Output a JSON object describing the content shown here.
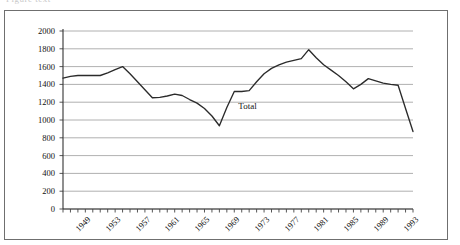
{
  "clipped_caption": "Figure text",
  "chart_data": {
    "type": "line",
    "title": "",
    "xlabel": "",
    "ylabel": "",
    "ylim": [
      0,
      2000
    ],
    "ytick_step": 200,
    "ytick_labels": [
      "2000",
      "1800",
      "1600",
      "1400",
      "1200",
      "1000",
      "800",
      "600",
      "400",
      "200",
      "0"
    ],
    "xlim": [
      1949,
      1996
    ],
    "xtick_labels": [
      "1949",
      "1953",
      "1957",
      "1961",
      "1965",
      "1969",
      "1973",
      "1977",
      "1981",
      "1985",
      "1989",
      "1993"
    ],
    "xtick_every": 4,
    "grid": "horizontal",
    "legend": "inline-annotation",
    "annotations": [
      {
        "text": "Total",
        "x": 1972,
        "y": 1150
      }
    ],
    "series": [
      {
        "name": "Total",
        "color": "#2b2b2b",
        "x": [
          1949,
          1950,
          1951,
          1952,
          1953,
          1954,
          1955,
          1956,
          1957,
          1958,
          1959,
          1960,
          1961,
          1962,
          1963,
          1964,
          1965,
          1966,
          1967,
          1968,
          1969,
          1970,
          1971,
          1972,
          1973,
          1974,
          1975,
          1976,
          1977,
          1978,
          1979,
          1980,
          1981,
          1982,
          1983,
          1984,
          1985,
          1986,
          1987,
          1988,
          1989,
          1990,
          1991,
          1992,
          1993,
          1994,
          1995,
          1996
        ],
        "values": [
          1470,
          1490,
          1500,
          1500,
          1500,
          1500,
          1530,
          1565,
          1600,
          1520,
          1430,
          1340,
          1250,
          1255,
          1270,
          1290,
          1275,
          1230,
          1190,
          1130,
          1045,
          935,
          1140,
          1320,
          1320,
          1330,
          1430,
          1520,
          1580,
          1620,
          1650,
          1670,
          1690,
          1790,
          1700,
          1620,
          1560,
          1500,
          1430,
          1350,
          1400,
          1465,
          1440,
          1415,
          1400,
          1390,
          1130,
          870
        ]
      }
    ]
  }
}
